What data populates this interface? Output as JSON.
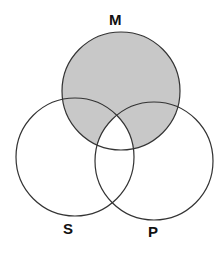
{
  "diagram": {
    "type": "venn-3",
    "circles": [
      {
        "id": "M",
        "label": "M",
        "cx": 121,
        "cy": 91,
        "r": 59
      },
      {
        "id": "S",
        "label": "S",
        "cx": 75,
        "cy": 157,
        "r": 59
      },
      {
        "id": "P",
        "label": "P",
        "cx": 154,
        "cy": 161,
        "r": 59
      }
    ],
    "shaded_regions": [
      "M only",
      "M∩S (not P)",
      "M∩P (not S)"
    ],
    "unshaded_regions": [
      "M∩S∩P",
      "S only",
      "P only",
      "S∩P (not M)"
    ],
    "colors": {
      "shade": "#c8c8c8",
      "stroke": "#333333",
      "background": "#ffffff",
      "label": "#111111"
    }
  }
}
